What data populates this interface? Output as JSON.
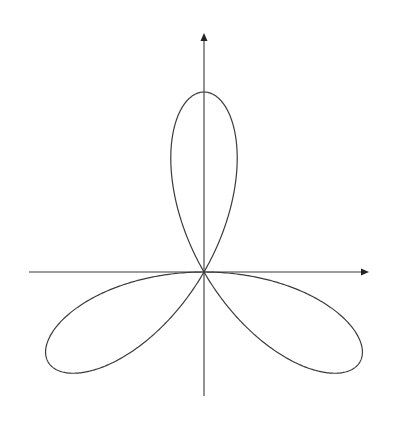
{
  "figure": {
    "type": "polar-rose",
    "equation_form": "r = a * cos(3 * (theta - 90deg))",
    "petal_count": 3,
    "petal_directions_deg": [
      90,
      210,
      330
    ],
    "colors": {
      "background": "#ffffff",
      "axis": "#3a3a3a",
      "curve": "#3c3c3c",
      "arrowhead": "#222222"
    }
  },
  "geometry": {
    "origin": {
      "x": 204,
      "y": 272
    },
    "amplitude_px": 180,
    "x_axis": {
      "x_start": 29,
      "x_end": 369,
      "y": 272
    },
    "y_axis": {
      "x": 204,
      "y_top": 33,
      "y_bottom": 396
    }
  }
}
